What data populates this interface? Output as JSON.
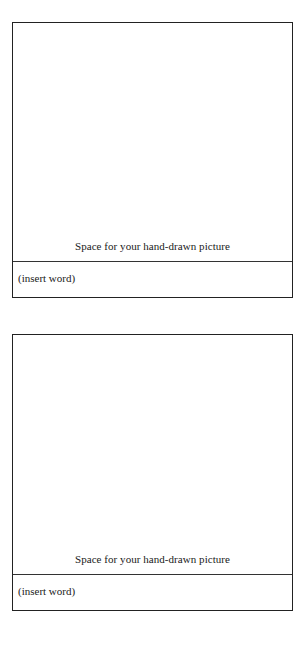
{
  "cards": [
    {
      "caption": "Space for your hand-drawn picture",
      "word_placeholder": "(insert word)"
    },
    {
      "caption": "Space for your hand-drawn picture",
      "word_placeholder": "(insert word)"
    }
  ]
}
